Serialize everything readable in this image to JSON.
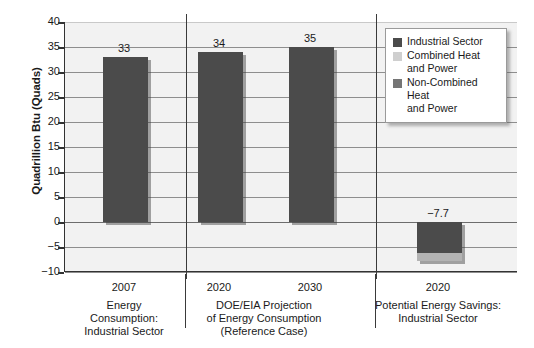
{
  "chart_data": {
    "type": "bar",
    "title": "",
    "xlabel": "",
    "ylabel": "Quadrillion Btu (Quads)",
    "ylim": [
      -10,
      40
    ],
    "ytick_values": [
      40,
      35,
      30,
      25,
      20,
      15,
      10,
      5,
      0,
      -5,
      -10
    ],
    "ytick_labels": [
      "40",
      "35",
      "30",
      "25",
      "20",
      "15",
      "10",
      "5",
      "0",
      "−5",
      "−10"
    ],
    "grid": true,
    "legend_position": "top-right",
    "categories": [
      "2007",
      "2020",
      "2030",
      "2020"
    ],
    "values": [
      33,
      34,
      35,
      -7.7
    ],
    "value_labels": [
      "33",
      "34",
      "35",
      "−7.7"
    ],
    "bars": [
      {
        "category": "2007",
        "group": "Energy Consumption: Industrial Sector",
        "value": 33,
        "label": "33",
        "series": "Industrial Sector",
        "segments": [
          {
            "series": "Industrial Sector",
            "from": 0,
            "to": 33,
            "color": "#4b4b4b"
          }
        ]
      },
      {
        "category": "2020",
        "group": "DOE/EIA Projection of Energy Consumption (Reference Case)",
        "value": 34,
        "label": "34",
        "series": "Industrial Sector",
        "segments": [
          {
            "series": "Industrial Sector",
            "from": 0,
            "to": 34,
            "color": "#4b4b4b"
          }
        ]
      },
      {
        "category": "2030",
        "group": "DOE/EIA Projection of Energy Consumption (Reference Case)",
        "value": 35,
        "label": "35",
        "series": "Industrial Sector",
        "segments": [
          {
            "series": "Industrial Sector",
            "from": 0,
            "to": 35,
            "color": "#4b4b4b"
          }
        ]
      },
      {
        "category": "2020",
        "group": "Potential Energy Savings: Industrial Sector",
        "value": -7.7,
        "label": "−7.7",
        "series": "Non-Combined Heat and Power + Combined Heat and Power",
        "segments": [
          {
            "series": "Non-Combined Heat and Power",
            "from": 0,
            "to": -6.2,
            "color": "#4b4b4b"
          },
          {
            "series": "Combined Heat and Power",
            "from": -6.2,
            "to": -7.7,
            "color": "#b3b3b3"
          }
        ]
      }
    ],
    "groups": [
      {
        "year_labels": [
          "2007"
        ],
        "caption": "Energy\nConsumption:\nIndustrial Sector"
      },
      {
        "year_labels": [
          "2020",
          "2030"
        ],
        "caption": "DOE/EIA Projection\nof Energy Consumption\n(Reference Case)"
      },
      {
        "year_labels": [
          "2020"
        ],
        "caption": "Potential Energy Savings:\nIndustrial Sector"
      }
    ],
    "legend": [
      {
        "label": "Industrial Sector",
        "color": "#4b4b4b"
      },
      {
        "label": "Combined Heat\nand Power",
        "color": "#cfcfcf"
      },
      {
        "label": "Non-Combined Heat\nand Power",
        "color": "#757575"
      }
    ],
    "colors": {
      "industrial_sector": "#4b4b4b",
      "combined_heat_and_power": "#cfcfcf",
      "non_combined_heat_and_power": "#757575",
      "plot_background": "#f2f2f2",
      "gridline": "#8e8e8e",
      "axis": "#333333"
    }
  }
}
